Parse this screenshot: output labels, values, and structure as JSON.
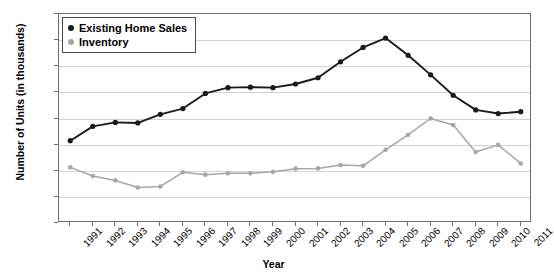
{
  "chart_data": {
    "type": "line",
    "title": "",
    "xlabel": "Year",
    "ylabel": "Number of Units (in thousands)",
    "ylim": [
      0,
      8000
    ],
    "ytick_step": 1000,
    "yticks": [
      0,
      1000,
      2000,
      3000,
      4000,
      5000,
      6000,
      7000,
      8000
    ],
    "grid": true,
    "legend_position": "top-left",
    "categories": [
      "1991",
      "1992",
      "1993",
      "1994",
      "1995",
      "1996",
      "1997",
      "1998",
      "1999",
      "2000",
      "2001",
      "2002",
      "2003",
      "2004",
      "2005",
      "2006",
      "2007",
      "2008",
      "2009",
      "2010",
      "2011"
    ],
    "series": [
      {
        "name": "Existing Home Sales",
        "color": "#1a1a1a",
        "marker": "circle",
        "values": [
          3150,
          3700,
          3850,
          3830,
          4160,
          4380,
          4960,
          5180,
          5200,
          5180,
          5320,
          5560,
          6170,
          6720,
          7080,
          6420,
          5670,
          4890,
          4330,
          4190,
          4260
        ]
      },
      {
        "name": "Inventory",
        "color": "#a6a6a6",
        "marker": "circle",
        "values": [
          2130,
          1800,
          1630,
          1360,
          1400,
          1940,
          1850,
          1900,
          1900,
          1960,
          2080,
          2090,
          2220,
          2190,
          2800,
          3380,
          4000,
          3750,
          2720,
          2990,
          2280
        ]
      }
    ]
  },
  "legend": {
    "items": [
      {
        "label": "Existing Home Sales",
        "color": "#1a1a1a"
      },
      {
        "label": "Inventory",
        "color": "#a6a6a6"
      }
    ]
  }
}
